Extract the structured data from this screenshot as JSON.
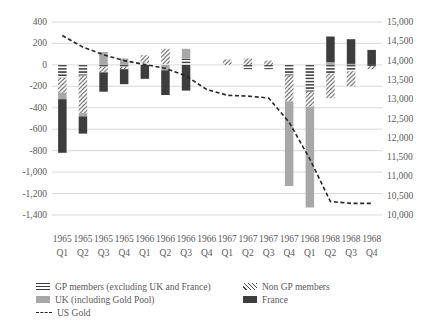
{
  "colors": {
    "uk_fill": "#a8a8a8",
    "france_fill": "#3d3d3d",
    "hatch_stroke": "#3d3d3d",
    "diag_stroke": "#4a4a4a",
    "line_stroke": "#262626",
    "grid": "#d9d9d9",
    "axis_text": "#595959",
    "background": "#ffffff"
  },
  "legend": {
    "items": [
      {
        "label": "GP members (excluding UK and France)",
        "swatch": "hhatch"
      },
      {
        "label": "UK (including Gold Pool)",
        "swatch": "uk"
      },
      {
        "label": "US Gold",
        "swatch": "line"
      },
      {
        "label": "Non GP members",
        "swatch": "dhatch"
      },
      {
        "label": "France",
        "swatch": "france"
      }
    ]
  },
  "chart_data": {
    "type": "bar",
    "subtype": "stacked-bars-with-line",
    "title": "",
    "xlabel": "",
    "ylabel": "",
    "categories": [
      {
        "year": "1965",
        "quarter": "Q1"
      },
      {
        "year": "1965",
        "quarter": "Q2"
      },
      {
        "year": "1965",
        "quarter": "Q3"
      },
      {
        "year": "1965",
        "quarter": "Q4"
      },
      {
        "year": "1966",
        "quarter": "Q1"
      },
      {
        "year": "1966",
        "quarter": "Q2"
      },
      {
        "year": "1966",
        "quarter": "Q3"
      },
      {
        "year": "1966",
        "quarter": "Q4"
      },
      {
        "year": "1967",
        "quarter": "Q1"
      },
      {
        "year": "1967",
        "quarter": "Q2"
      },
      {
        "year": "1967",
        "quarter": "Q3"
      },
      {
        "year": "1967",
        "quarter": "Q4"
      },
      {
        "year": "1968",
        "quarter": "Q1"
      },
      {
        "year": "1968",
        "quarter": "Q2"
      },
      {
        "year": "1968",
        "quarter": "Q3"
      },
      {
        "year": "1968",
        "quarter": "Q4"
      }
    ],
    "series": [
      {
        "name": "GP members (excluding UK and France)",
        "type": "bar",
        "fill": "hhatch",
        "values": [
          -120,
          -100,
          -20,
          -20,
          20,
          10,
          60,
          0,
          0,
          -40,
          -40,
          -100,
          -250,
          -80,
          -60,
          -10
        ]
      },
      {
        "name": "Non GP members",
        "type": "bar",
        "fill": "dhatch",
        "values": [
          -140,
          -350,
          -50,
          -20,
          70,
          140,
          0,
          0,
          50,
          60,
          40,
          -240,
          -140,
          -230,
          -140,
          -30
        ]
      },
      {
        "name": "UK (including Gold Pool)",
        "type": "bar",
        "fill": "uk",
        "values": [
          -60,
          -30,
          120,
          60,
          0,
          -50,
          90,
          0,
          0,
          0,
          0,
          -790,
          -940,
          25,
          10,
          0
        ]
      },
      {
        "name": "France",
        "type": "bar",
        "fill": "france",
        "values": [
          -500,
          -160,
          -180,
          -140,
          -130,
          -230,
          -240,
          0,
          0,
          0,
          0,
          0,
          0,
          240,
          230,
          140
        ]
      },
      {
        "name": "US Gold",
        "type": "line",
        "axis": "right",
        "dashed": true,
        "values": [
          14650,
          14350,
          14150,
          14000,
          13900,
          13800,
          13600,
          13250,
          13100,
          13080,
          13030,
          12400,
          11450,
          10350,
          10300,
          10300
        ]
      }
    ],
    "left_axis": {
      "min": -1400,
      "max": 400,
      "step": 200,
      "tick_labels": [
        "400",
        "200",
        "0",
        "-200",
        "-400",
        "-600",
        "-800",
        "-1,000",
        "-1,200",
        "-1,400"
      ]
    },
    "right_axis": {
      "min": 10000,
      "max": 15000,
      "step": 500,
      "tick_labels": [
        "15,000",
        "14,500",
        "14,000",
        "13,500",
        "13,000",
        "12,500",
        "12,000",
        "11,500",
        "11,000",
        "10,500",
        "10,000"
      ]
    },
    "grid": "horizontal",
    "legend_position": "bottom"
  }
}
